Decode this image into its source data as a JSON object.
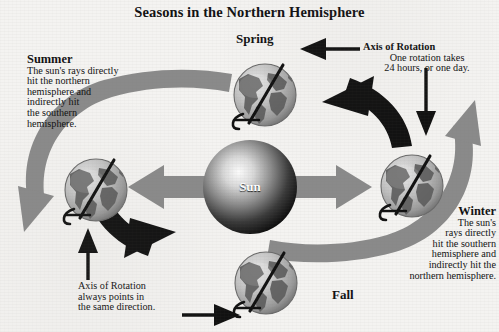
{
  "figure": {
    "title": "Seasons in the Northern Hemisphere",
    "type": "diagram",
    "palette": {
      "background": "#f4f3f1",
      "ink": "#111111",
      "orbit_arrow_gray": "#8a8a8a",
      "sun_dark": "#0e0e0e",
      "sun_highlight": "#f2f2f2",
      "globe_land": "#5f5f5f",
      "globe_ocean": "#c9c9c9"
    }
  },
  "center": {
    "body_label": "Sun"
  },
  "seasons": [
    {
      "id": "spring",
      "label": "Spring",
      "position": "top"
    },
    {
      "id": "summer",
      "label": "Summer",
      "position": "left"
    },
    {
      "id": "fall",
      "label": "Fall",
      "position": "bottom"
    },
    {
      "id": "winter",
      "label": "Winter",
      "position": "right"
    }
  ],
  "callouts": {
    "summer": {
      "heading": "Summer",
      "lines": [
        "The sun's rays directly",
        "hit the northern",
        "hemisphere and",
        "indirectly hit",
        "the southern",
        "hemisphere."
      ]
    },
    "winter": {
      "heading": "Winter",
      "lines": [
        "The sun's",
        "rays directly",
        "hit the southern",
        "hemisphere and",
        "indirectly hit the",
        "northern hemisphere."
      ]
    },
    "axis_top": {
      "heading": "Axis of Rotation",
      "line2": "One rotation takes",
      "line3": "24 hours, or one day."
    },
    "axis_bottom": {
      "line1": "Axis of Rotation",
      "line2": "always points in",
      "line3": "the same direction."
    }
  },
  "icons": {
    "globe": "globe-icon",
    "axis": "axis-line-icon",
    "axis_marker": "axis-marker-icon",
    "orbit_arrow": "orbit-arrow-icon",
    "pointer_arrow": "pointer-arrow-icon",
    "sun": "sun-icon"
  }
}
